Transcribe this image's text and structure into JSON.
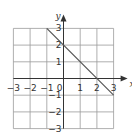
{
  "chart_data": {
    "type": "line",
    "title": "",
    "xlabel": "x",
    "ylabel": "y",
    "xlim": [
      -3,
      3
    ],
    "ylim": [
      -3,
      3
    ],
    "grid": true,
    "x_ticks": [
      "-3",
      "-2",
      "-1",
      "0",
      "1",
      "2",
      "3"
    ],
    "y_ticks": [
      "3",
      "2",
      "1",
      "-1",
      "-2",
      "-3"
    ],
    "series": [
      {
        "name": "y = -x + 2",
        "x": [
          -1,
          3
        ],
        "y": [
          3,
          -1
        ]
      }
    ]
  },
  "colors": {
    "grid": "#9a9a9a",
    "axis": "#333333",
    "line": "#555555",
    "text": "#333333"
  }
}
